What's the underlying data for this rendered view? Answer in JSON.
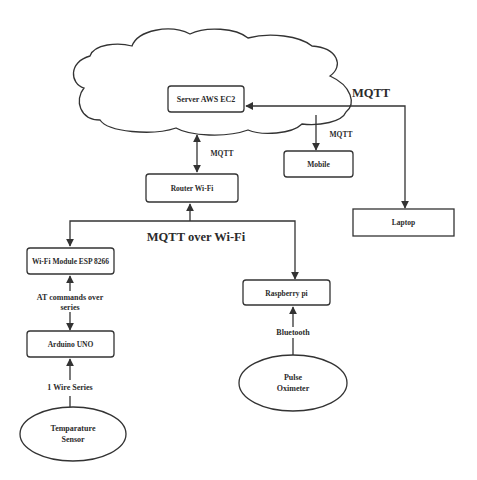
{
  "diagram": {
    "nodes": {
      "cloud": {
        "label": ""
      },
      "server": {
        "label": "Server AWS EC2"
      },
      "mobile": {
        "label": "Mobile"
      },
      "laptop": {
        "label": "Laptop"
      },
      "router": {
        "label": "Router  Wi-Fi"
      },
      "wifi_module": {
        "label": "Wi-Fi Module ESP 8266"
      },
      "raspberry": {
        "label": "Raspberry pi"
      },
      "arduino": {
        "label": "Arduino UNO"
      },
      "temp_sensor": {
        "line1": "Temparature",
        "line2": "Sensor"
      },
      "pulse_oximeter": {
        "line1": "Pulse",
        "line2": "Oximeter"
      }
    },
    "edges": {
      "laptop_server": {
        "label": "MQTT"
      },
      "server_mobile": {
        "label": "MQTT"
      },
      "server_router": {
        "label": "MQTT"
      },
      "router_devices": {
        "label": "MQTT over Wi-Fi"
      },
      "wifi_arduino": {
        "line1": "AT commands over",
        "line2": "series"
      },
      "sensor_arduino": {
        "label": "1 Wire  Series"
      },
      "oximeter_raspberry": {
        "label": "Bluetooth"
      }
    },
    "colors": {
      "line": "#333333",
      "text": "#2b2b2b",
      "background": "#ffffff"
    }
  }
}
